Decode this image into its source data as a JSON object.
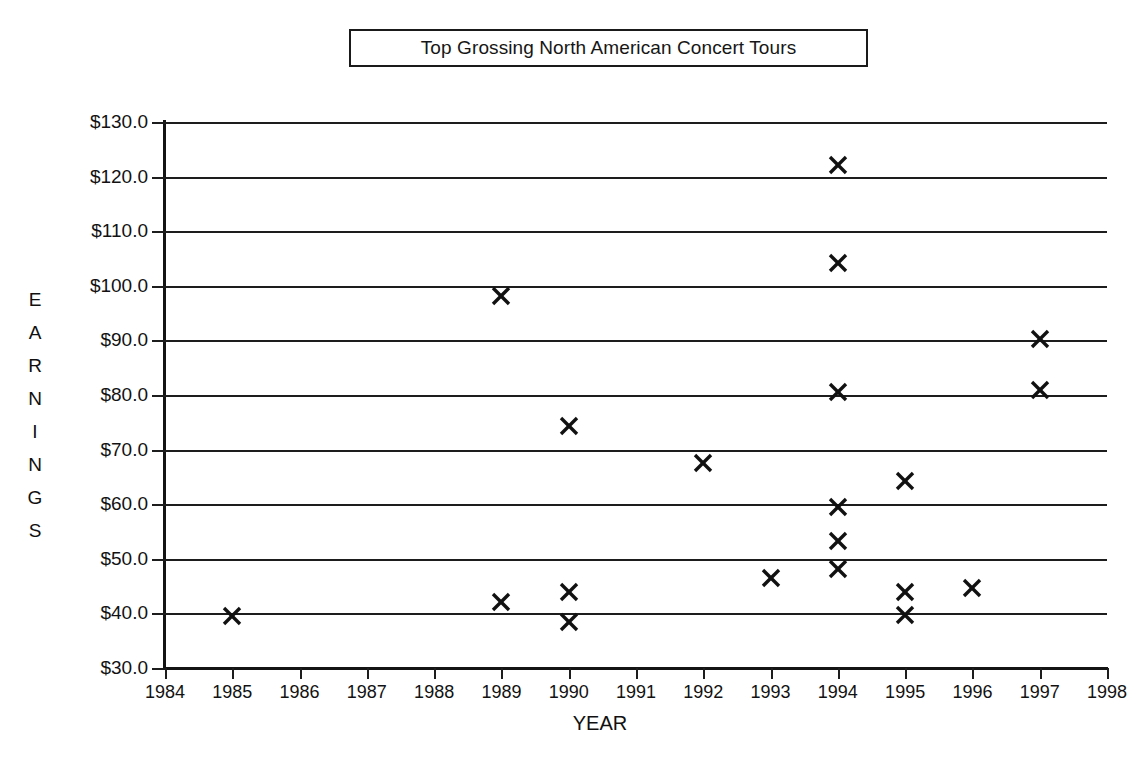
{
  "chart_data": {
    "type": "scatter",
    "title": "Top Grossing North American Concert Tours",
    "xlabel": "YEAR",
    "ylabel": "EARNINGS",
    "ylabel_letters": [
      "E",
      "A",
      "R",
      "N",
      "I",
      "N",
      "G",
      "S"
    ],
    "xlim": [
      1984,
      1998
    ],
    "ylim": [
      30.0,
      130.0
    ],
    "grid": true,
    "legend": null,
    "marker": "x",
    "marker_color": "#111111",
    "x_tick_labels": [
      "1984",
      "1985",
      "1986",
      "1987",
      "1988",
      "1989",
      "1990",
      "1991",
      "1992",
      "1993",
      "1994",
      "1995",
      "1996",
      "1997",
      "1998"
    ],
    "x_ticks": [
      1984,
      1985,
      1986,
      1987,
      1988,
      1989,
      1990,
      1991,
      1992,
      1993,
      1994,
      1995,
      1996,
      1997,
      1998
    ],
    "y_tick_labels": [
      "$130.0",
      "$120.0",
      "$110.0",
      "$100.0",
      "$90.0",
      "$80.0",
      "$70.0",
      "$60.0",
      "$50.0",
      "$40.0",
      "$30.0"
    ],
    "y_ticks": [
      130.0,
      120.0,
      110.0,
      100.0,
      90.0,
      80.0,
      70.0,
      60.0,
      50.0,
      40.0,
      30.0
    ],
    "points": [
      {
        "x": 1985,
        "y": 39.5
      },
      {
        "x": 1989,
        "y": 98.2
      },
      {
        "x": 1989,
        "y": 42.0
      },
      {
        "x": 1990,
        "y": 74.4
      },
      {
        "x": 1990,
        "y": 43.9
      },
      {
        "x": 1990,
        "y": 38.4
      },
      {
        "x": 1992,
        "y": 67.5
      },
      {
        "x": 1993,
        "y": 46.4
      },
      {
        "x": 1994,
        "y": 122.2
      },
      {
        "x": 1994,
        "y": 104.1
      },
      {
        "x": 1994,
        "y": 80.5
      },
      {
        "x": 1994,
        "y": 59.5
      },
      {
        "x": 1994,
        "y": 53.2
      },
      {
        "x": 1994,
        "y": 48.2
      },
      {
        "x": 1995,
        "y": 64.3
      },
      {
        "x": 1995,
        "y": 44.0
      },
      {
        "x": 1995,
        "y": 39.7
      },
      {
        "x": 1996,
        "y": 44.7
      },
      {
        "x": 1997,
        "y": 90.2
      },
      {
        "x": 1997,
        "y": 81.0
      }
    ]
  }
}
